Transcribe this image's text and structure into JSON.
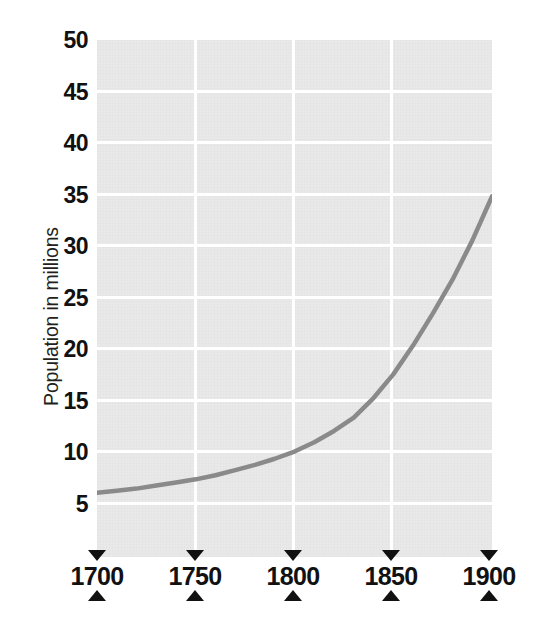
{
  "chart_data": {
    "type": "line",
    "title": "",
    "subtitle": "",
    "xlabel": "",
    "ylabel": "Population in millions",
    "grid": true,
    "legend": false,
    "legend_position": "none",
    "xlim": [
      1700,
      1900
    ],
    "ylim": [
      0,
      50
    ],
    "x_ticks": [
      "1700",
      "1750",
      "1800",
      "1850",
      "1900"
    ],
    "x_tick_values": [
      1700,
      1750,
      1800,
      1850,
      1900
    ],
    "y_ticks": [
      "5",
      "10",
      "15",
      "20",
      "25",
      "30",
      "35",
      "40",
      "45",
      "50"
    ],
    "y_tick_values": [
      5,
      10,
      15,
      20,
      25,
      30,
      35,
      40,
      45,
      50
    ],
    "x": [
      1700,
      1710,
      1720,
      1730,
      1740,
      1750,
      1760,
      1770,
      1780,
      1790,
      1800,
      1810,
      1820,
      1830,
      1840,
      1850,
      1860,
      1870,
      1880,
      1890,
      1900
    ],
    "values": [
      6.0,
      6.2,
      6.4,
      6.7,
      7.0,
      7.3,
      7.7,
      8.2,
      8.7,
      9.3,
      10.0,
      10.9,
      12.0,
      13.3,
      15.2,
      17.5,
      20.3,
      23.4,
      26.7,
      30.5,
      34.8
    ],
    "series": [
      {
        "name": "Population",
        "color": "#8a8a8a",
        "values": [
          6.0,
          6.2,
          6.4,
          6.7,
          7.0,
          7.3,
          7.7,
          8.2,
          8.7,
          9.3,
          10.0,
          10.9,
          12.0,
          13.3,
          15.2,
          17.5,
          20.3,
          23.4,
          26.7,
          30.5,
          34.8
        ]
      }
    ],
    "colors": {
      "plot_background": "#e9e9e9",
      "gridline": "#ffffff",
      "curve": "#8a8a8a",
      "tick_marker": "#111111",
      "label_text": "#111111",
      "axis_title_text": "#231f20",
      "page_background": "#ffffff"
    }
  },
  "axes": {
    "y_title": "Population in millions",
    "y_labels": [
      "50",
      "45",
      "40",
      "35",
      "30",
      "25",
      "20",
      "15",
      "10",
      "5"
    ],
    "x_labels": [
      "1700",
      "1750",
      "1800",
      "1850",
      "1900"
    ]
  }
}
